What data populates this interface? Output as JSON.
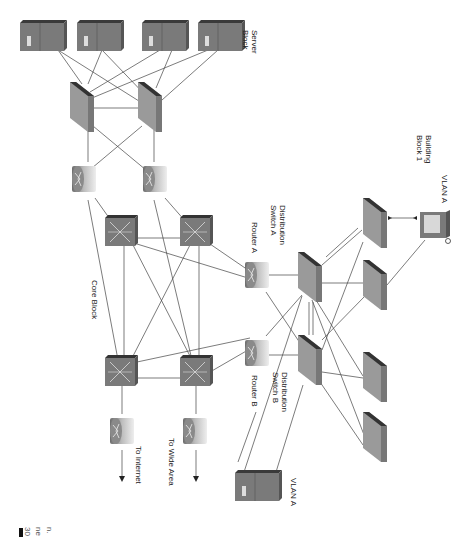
{
  "figure": {
    "orientation": "rotated 90deg clockwise",
    "colors": {
      "device": "#7a7a7a",
      "device_dark": "#3a3a3a",
      "device_light": "#a8a8a8",
      "line": "#444444",
      "text": "#222222"
    },
    "labels": {
      "server_block": [
        "Server",
        "Block"
      ],
      "core_block": "Core Block",
      "router_a": "Router A",
      "router_b": "Router B",
      "dist_switch_a": [
        "Distribution",
        "Switch A"
      ],
      "dist_switch_b": [
        "Distribution",
        "Switch B"
      ],
      "building_block": [
        "Building",
        "Block 1"
      ],
      "vlan_a_pc": "VLAN A",
      "vlan_a_server": "VLAN A",
      "to_internet": "To Internet",
      "to_wide_area": "To Wide Area"
    },
    "page_fragments": [
      "30",
      "ne",
      "n."
    ]
  },
  "nodes": [
    {
      "id": "srv1",
      "type": "server",
      "label": ""
    },
    {
      "id": "srv2",
      "type": "server",
      "label": ""
    },
    {
      "id": "srv3",
      "type": "server",
      "label": ""
    },
    {
      "id": "srv4",
      "type": "server",
      "label": ""
    },
    {
      "id": "sbsw1",
      "type": "switch",
      "label": ""
    },
    {
      "id": "sbsw2",
      "type": "switch",
      "label": ""
    },
    {
      "id": "rtr_top1",
      "type": "router",
      "label": ""
    },
    {
      "id": "rtr_top2",
      "type": "router",
      "label": ""
    },
    {
      "id": "core1",
      "type": "multilayer-switch",
      "label": ""
    },
    {
      "id": "core2",
      "type": "multilayer-switch",
      "label": ""
    },
    {
      "id": "core3",
      "type": "multilayer-switch",
      "label": ""
    },
    {
      "id": "core4",
      "type": "multilayer-switch",
      "label": ""
    },
    {
      "id": "rtr_inet",
      "type": "router",
      "label": "To Internet"
    },
    {
      "id": "rtr_wan",
      "type": "router",
      "label": "To Wide Area"
    },
    {
      "id": "rtrA",
      "type": "router",
      "label": "Router A"
    },
    {
      "id": "rtrB",
      "type": "router",
      "label": "Router B"
    },
    {
      "id": "distA",
      "type": "switch",
      "label": "Distribution Switch A"
    },
    {
      "id": "distB",
      "type": "switch",
      "label": "Distribution Switch B"
    },
    {
      "id": "acc1",
      "type": "switch",
      "label": ""
    },
    {
      "id": "acc2",
      "type": "switch",
      "label": ""
    },
    {
      "id": "acc3",
      "type": "switch",
      "label": ""
    },
    {
      "id": "acc4",
      "type": "switch",
      "label": ""
    },
    {
      "id": "pcA",
      "type": "workstation",
      "label": "VLAN A"
    },
    {
      "id": "srvA",
      "type": "server",
      "label": "VLAN A"
    }
  ]
}
